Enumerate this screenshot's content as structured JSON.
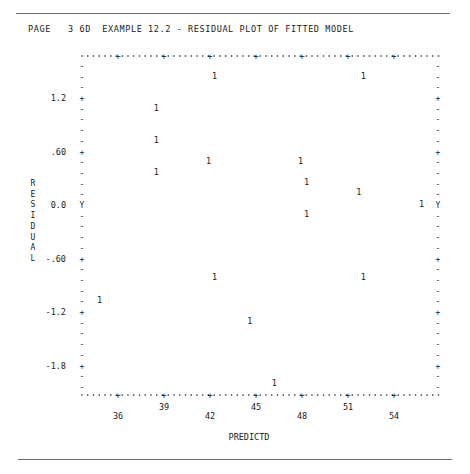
{
  "header": {
    "title": "PAGE   3 6D  EXAMPLE 12.2 - RESIDUAL PLOT OF FITTED MODEL"
  },
  "chart_data": {
    "type": "scatter",
    "title": "EXAMPLE 12.2 - RESIDUAL PLOT OF FITTED MODEL",
    "page_label": "PAGE   3 6D",
    "xlabel": "PREDICTD",
    "ylabel": "RESIDUAL",
    "x_ticks": [
      36,
      39,
      42,
      45,
      48,
      51,
      54
    ],
    "x_tick_labels": [
      "36",
      "39",
      "42",
      "45",
      "48",
      "51",
      "54"
    ],
    "y_ticks": [
      1.2,
      0.6,
      0.0,
      -0.6,
      -1.2,
      -1.8
    ],
    "y_tick_labels": [
      "1.2",
      ".60",
      "0.0",
      "-.60",
      "-1.2",
      "-1.8"
    ],
    "zero_marker": "Y",
    "plot_symbol": "1",
    "xlim": [
      33.7,
      56.9
    ],
    "ylim": [
      -2.14,
      1.68
    ],
    "grid": false,
    "legend": null,
    "points": [
      {
        "x": 42.3,
        "y": 1.45
      },
      {
        "x": 52.0,
        "y": 1.45
      },
      {
        "x": 38.5,
        "y": 1.09
      },
      {
        "x": 38.5,
        "y": 0.73
      },
      {
        "x": 41.9,
        "y": 0.49
      },
      {
        "x": 47.9,
        "y": 0.49
      },
      {
        "x": 38.5,
        "y": 0.37
      },
      {
        "x": 48.3,
        "y": 0.26
      },
      {
        "x": 51.7,
        "y": 0.15
      },
      {
        "x": 55.8,
        "y": 0.01
      },
      {
        "x": 48.3,
        "y": -0.1
      },
      {
        "x": 42.3,
        "y": -0.81
      },
      {
        "x": 52.0,
        "y": -0.81
      },
      {
        "x": 34.8,
        "y": -1.06
      },
      {
        "x": 44.6,
        "y": -1.3
      },
      {
        "x": 46.2,
        "y": -2.0
      }
    ]
  }
}
